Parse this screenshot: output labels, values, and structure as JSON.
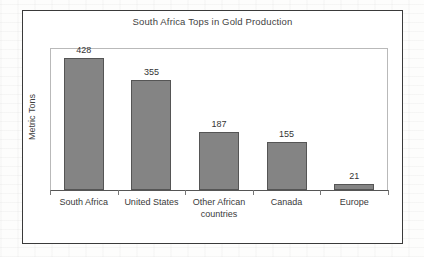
{
  "chart_data": {
    "type": "bar",
    "title": "South Africa Tops in Gold Production",
    "xlabel": "",
    "ylabel": "Metric Tons",
    "categories": [
      "South Africa",
      "United States",
      "Other African countries",
      "Canada",
      "Europe"
    ],
    "category_lines": [
      [
        "South Africa"
      ],
      [
        "United States"
      ],
      [
        "Other African",
        "countries"
      ],
      [
        "Canada"
      ],
      [
        "Europe"
      ]
    ],
    "values": [
      428,
      355,
      187,
      155,
      21
    ],
    "value_labels": [
      "428",
      "355",
      "187",
      "155",
      "21"
    ],
    "ylim": [
      0,
      460
    ],
    "grid": false,
    "legend": false,
    "bar_color": "#848484",
    "bar_border_color": "#555555",
    "axis_color": "#555555",
    "plot_border_color": "#b9b9b9",
    "frame_color": "#3a3a3a",
    "text_color": "#3a3a3a"
  }
}
